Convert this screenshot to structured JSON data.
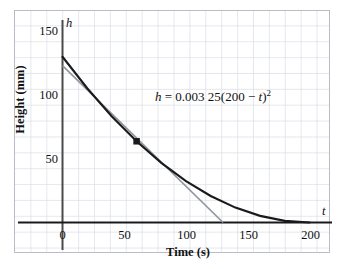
{
  "chart_data": {
    "type": "line",
    "title": "",
    "xlabel": "Time (s)",
    "ylabel": "Height (mm)",
    "xlim": [
      -10,
      215
    ],
    "ylim": [
      -10,
      160
    ],
    "xticks": [
      0,
      50,
      100,
      150,
      200
    ],
    "yticks": [
      50,
      100,
      150
    ],
    "grid": true,
    "axis_name_x": "t",
    "axis_name_y": "h",
    "annotation": "h = 0.003 25(200 − t)²",
    "equation": {
      "lhs": "h",
      "equals": "=",
      "coefficient": "0.003 25",
      "body": "(200 − t)",
      "exponent": "2"
    },
    "series": [
      {
        "name": "height-curve",
        "type": "quadratic",
        "color": "#1a1a1a",
        "formula_a": 0.00325,
        "formula_t0": 200,
        "x_start": 0,
        "x_end": 200,
        "points": [
          {
            "t": 0,
            "h": 130
          },
          {
            "t": 20,
            "h": 105.3
          },
          {
            "t": 40,
            "h": 83.2
          },
          {
            "t": 60,
            "h": 63.7
          },
          {
            "t": 80,
            "h": 46.8
          },
          {
            "t": 100,
            "h": 32.5
          },
          {
            "t": 120,
            "h": 20.8
          },
          {
            "t": 140,
            "h": 11.7
          },
          {
            "t": 160,
            "h": 5.2
          },
          {
            "t": 180,
            "h": 1.3
          },
          {
            "t": 200,
            "h": 0
          }
        ]
      },
      {
        "name": "tangent-line",
        "type": "line",
        "color": "#8f949c",
        "x_start": 0,
        "y_start": 123,
        "x_end": 130,
        "y_end": 0,
        "tangent_at_t": 60
      }
    ],
    "markers": [
      {
        "name": "tangent-point",
        "t": 60,
        "h": 63.7,
        "color": "#1a1a1a",
        "shape": "square"
      }
    ],
    "tick_labels": {
      "y": [
        "150",
        "100",
        "50"
      ],
      "x": [
        "0",
        "50",
        "100",
        "150",
        "200"
      ]
    }
  }
}
